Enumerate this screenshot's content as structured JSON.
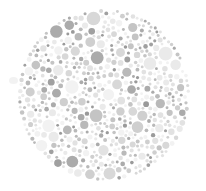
{
  "image": {
    "kind": "ishihara-plate",
    "title": "Ishihara color vision test plate",
    "description": "Grayscale pseudoisochromatic plate composed of densely packed circles of varying size and gray value",
    "width": 206,
    "height": 191,
    "background_color": "#ffffff",
    "hidden_figure_legible": "no",
    "alt_text": "A circular field of small gray dots of many sizes on a white background"
  },
  "plate": {
    "center_x": 104,
    "center_y": 95,
    "radius": 88,
    "edge_softness": 2
  },
  "dots": {
    "count": 1350,
    "radius_min": 1.4,
    "radius_max": 7.0,
    "radius_bias": 1.65,
    "packing_attempts": 26000,
    "gap": 0.55,
    "seed": 20240517,
    "palette": [
      {
        "color": "#f2f2f2",
        "weight": 17
      },
      {
        "color": "#eaeaea",
        "weight": 15
      },
      {
        "color": "#e2e2e2",
        "weight": 13
      },
      {
        "color": "#d8d8d8",
        "weight": 12
      },
      {
        "color": "#cfcfcf",
        "weight": 10
      },
      {
        "color": "#c4c4c4",
        "weight": 9
      },
      {
        "color": "#b9b9b9",
        "weight": 8
      },
      {
        "color": "#aeaea",
        "weight": 0
      },
      {
        "color": "#ababab",
        "weight": 7
      },
      {
        "color": "#a0a0a0",
        "weight": 5
      },
      {
        "color": "#9a9a9a",
        "weight": 4
      }
    ]
  },
  "artifact": {
    "label": "faint-smudge",
    "x": 9,
    "y": 77,
    "width": 9,
    "height": 7,
    "color": "#ededed"
  }
}
